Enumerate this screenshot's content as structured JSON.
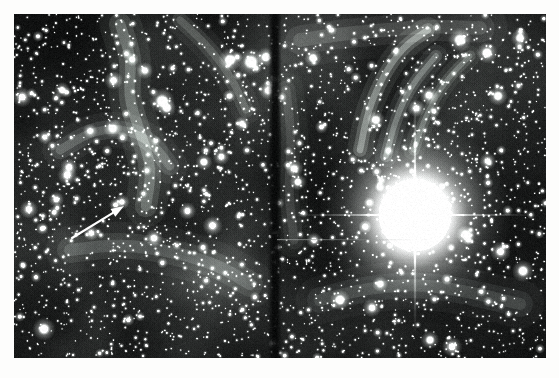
{
  "page": {
    "background_color": "#fdfdfc",
    "width": 559,
    "height": 378
  },
  "figure": {
    "kind": "astronomical-photograph",
    "description": "Deep wide-field photographic plate of a dense star field with diffuse filamentary nebulosity",
    "frame": {
      "x": 14,
      "y": 14,
      "width": 532,
      "height": 344
    },
    "border_color": "#ffffff",
    "sky_background_color": "#101111",
    "nebula_color": "#8a8f8d",
    "star_color": "#ffffff",
    "panels": [
      {
        "name": "left-panel",
        "x": 14,
        "y": 14,
        "width": 259,
        "height": 344
      },
      {
        "name": "right-panel",
        "x": 277,
        "y": 14,
        "width": 269,
        "height": 344
      }
    ],
    "seam": {
      "name": "vertical-plate-seam",
      "x": 273,
      "width": 4,
      "color": "#090a0a"
    },
    "scan_line": {
      "name": "horizontal-scan-artifact",
      "y": 239,
      "x_start": 277,
      "x_end": 420,
      "color": "#6e7271"
    },
    "bright_star": {
      "name": "saturated-bright-star",
      "center_x": 415,
      "center_y": 215,
      "core_radius": 36,
      "halo_radius": 96,
      "color": "#ffffff"
    },
    "arrow": {
      "name": "pointer-arrow",
      "tail_x": 72,
      "tail_y": 238,
      "tip_x": 124,
      "tip_y": 206,
      "color": "#ffffff",
      "line_width": 2.2,
      "head_length": 13,
      "head_width": 9
    },
    "marked_object": {
      "name": "arrow-target-object",
      "x": 122,
      "y": 202,
      "radius": 3
    },
    "star_field": {
      "total_stars": 2600,
      "bright_clumps": [
        {
          "x": 230,
          "y": 60,
          "r": 5.0
        },
        {
          "x": 251,
          "y": 62,
          "r": 6.0
        },
        {
          "x": 266,
          "y": 57,
          "r": 4.2
        },
        {
          "x": 162,
          "y": 101,
          "r": 5.5
        },
        {
          "x": 167,
          "y": 108,
          "r": 4.0
        },
        {
          "x": 44,
          "y": 329,
          "r": 5.0
        },
        {
          "x": 62,
          "y": 90,
          "r": 3.4
        },
        {
          "x": 204,
          "y": 162,
          "r": 3.6
        },
        {
          "x": 460,
          "y": 40,
          "r": 5.2
        },
        {
          "x": 487,
          "y": 53,
          "r": 4.6
        },
        {
          "x": 520,
          "y": 38,
          "r": 4.0
        },
        {
          "x": 498,
          "y": 96,
          "r": 4.2
        },
        {
          "x": 313,
          "y": 58,
          "r": 3.8
        },
        {
          "x": 340,
          "y": 300,
          "r": 4.4
        },
        {
          "x": 523,
          "y": 271,
          "r": 4.8
        },
        {
          "x": 430,
          "y": 340,
          "r": 4.0
        },
        {
          "x": 298,
          "y": 182,
          "r": 3.6
        },
        {
          "x": 376,
          "y": 120,
          "r": 4.0
        }
      ]
    },
    "nebula_filaments": [
      {
        "name": "left-central-wisp",
        "points": [
          [
            120,
            24
          ],
          [
            132,
            60
          ],
          [
            128,
            96
          ],
          [
            140,
            132
          ],
          [
            152,
            168
          ],
          [
            146,
            206
          ]
        ],
        "width": 26,
        "alpha": 0.22
      },
      {
        "name": "left-arc-wisp",
        "points": [
          [
            60,
            150
          ],
          [
            90,
            132
          ],
          [
            120,
            128
          ],
          [
            150,
            140
          ],
          [
            170,
            166
          ]
        ],
        "width": 22,
        "alpha": 0.18
      },
      {
        "name": "left-lower-haze",
        "points": [
          [
            70,
            250
          ],
          [
            120,
            244
          ],
          [
            176,
            252
          ],
          [
            220,
            266
          ],
          [
            250,
            284
          ]
        ],
        "width": 30,
        "alpha": 0.15
      },
      {
        "name": "left-upper-diagonal",
        "points": [
          [
            180,
            20
          ],
          [
            208,
            46
          ],
          [
            232,
            78
          ],
          [
            246,
            110
          ]
        ],
        "width": 18,
        "alpha": 0.17
      },
      {
        "name": "right-arc-a",
        "points": [
          [
            360,
            150
          ],
          [
            368,
            110
          ],
          [
            384,
            74
          ],
          [
            404,
            46
          ],
          [
            428,
            30
          ]
        ],
        "width": 16,
        "alpha": 0.3
      },
      {
        "name": "right-arc-b",
        "points": [
          [
            386,
            156
          ],
          [
            396,
            118
          ],
          [
            412,
            84
          ],
          [
            436,
            56
          ]
        ],
        "width": 14,
        "alpha": 0.26
      },
      {
        "name": "right-arc-c",
        "points": [
          [
            414,
            150
          ],
          [
            426,
            114
          ],
          [
            446,
            80
          ],
          [
            470,
            56
          ]
        ],
        "width": 13,
        "alpha": 0.22
      },
      {
        "name": "right-top-haze",
        "points": [
          [
            300,
            40
          ],
          [
            340,
            34
          ],
          [
            386,
            30
          ],
          [
            430,
            26
          ],
          [
            480,
            28
          ]
        ],
        "width": 34,
        "alpha": 0.14
      },
      {
        "name": "right-lower-haze",
        "points": [
          [
            320,
            300
          ],
          [
            368,
            288
          ],
          [
            420,
            284
          ],
          [
            470,
            292
          ],
          [
            520,
            304
          ]
        ],
        "width": 30,
        "alpha": 0.13
      },
      {
        "name": "right-left-edge-haze",
        "points": [
          [
            286,
            90
          ],
          [
            292,
            140
          ],
          [
            288,
            190
          ],
          [
            294,
            240
          ]
        ],
        "width": 22,
        "alpha": 0.12
      }
    ]
  }
}
